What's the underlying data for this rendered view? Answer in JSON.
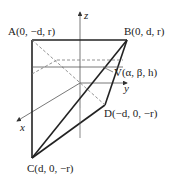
{
  "diagram": {
    "type": "3d-geometry",
    "points": {
      "A": {
        "label": "A(0, −d, r)"
      },
      "B": {
        "label": "B(0, d, r)"
      },
      "C": {
        "label": "C(d, 0, −r)"
      },
      "D": {
        "label": "D(−d, 0, −r)"
      },
      "V": {
        "label": "V(α, β, h)"
      }
    },
    "axes": {
      "x": "x",
      "y": "y",
      "z": "z"
    },
    "colors": {
      "stroke": "#222222",
      "thin": "#555555",
      "dashed": "#777777"
    }
  }
}
